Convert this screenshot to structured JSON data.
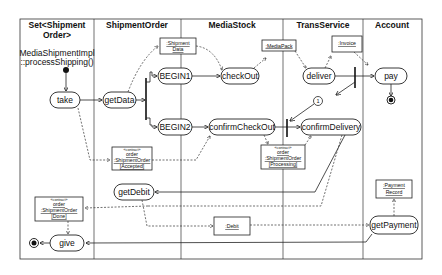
{
  "diagram": {
    "type": "UML activity diagram with swimlanes",
    "swimlanes": [
      {
        "id": "set",
        "title_line1": "Set<Shipment",
        "title_line2": "Order>"
      },
      {
        "id": "shipmentorder",
        "title": "ShipmentOrder"
      },
      {
        "id": "mediastock",
        "title": "MediaStock"
      },
      {
        "id": "transservice",
        "title": "TransService"
      },
      {
        "id": "account",
        "title": "Account"
      }
    ],
    "note": {
      "line1": "MediaShipmentImpl",
      "line2": "::processShipping()"
    },
    "actions": {
      "take": "take",
      "getData": "getData",
      "begin1": "BEGIN1",
      "begin2": "BEGIN2",
      "checkOut": "checkOut",
      "confirmCheckOut": "confirmCheckOut",
      "deliver": "deliver",
      "confirmDelivery": "confirmDelivery",
      "pay": "pay",
      "getDebit": "getDebit",
      "getPayment": "getPayment",
      "give": "give"
    },
    "objects": {
      "shipmentData": {
        "line1": ":Shipment",
        "line2": "Data"
      },
      "mediaPack": {
        "line1": ":MediaPack"
      },
      "invoice": {
        "line1": ":Invoice"
      },
      "orderAccepted": {
        "stereotype": "«contract»",
        "line1": "order",
        "line2": ":ShipmentOrder",
        "line3": "[Accepted]"
      },
      "orderProcessing": {
        "stereotype": "«contract»",
        "line1": "order",
        "line2": ":ShipmentOrder",
        "line3": "[Processing]"
      },
      "orderDone": {
        "stereotype": "«contract»",
        "line1": "order",
        "line2": ":ShipmentOrder",
        "line3": "[Done]"
      },
      "debit": {
        "line1": ":Debit"
      },
      "paymentRecord": {
        "line1": ":Payment",
        "line2": "Record"
      }
    },
    "connector": {
      "label": "1"
    }
  }
}
